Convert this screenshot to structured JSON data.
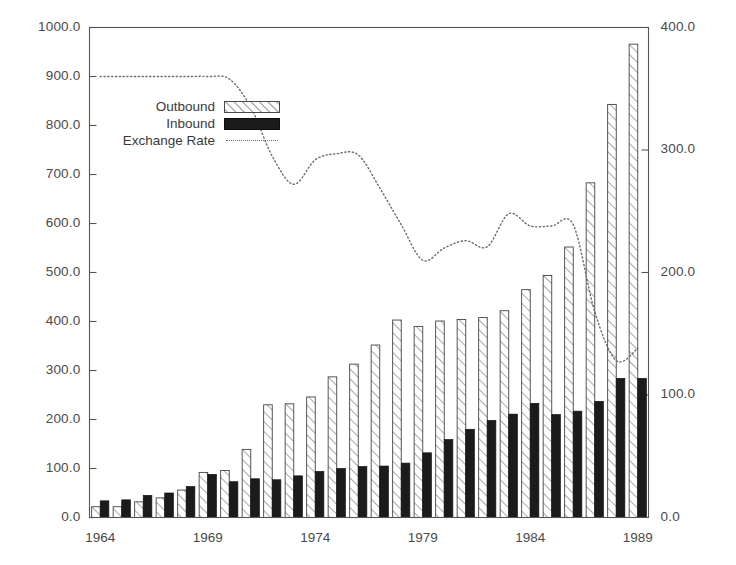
{
  "chart_data": {
    "type": "bar",
    "title": "",
    "subtitle": "",
    "xlabel": "",
    "ylabel": "",
    "y2label": "",
    "grid": false,
    "legend_position": "upper-left-inside",
    "x": [
      1964,
      1965,
      1966,
      1967,
      1968,
      1969,
      1970,
      1971,
      1972,
      1973,
      1974,
      1975,
      1976,
      1977,
      1978,
      1979,
      1980,
      1981,
      1982,
      1983,
      1984,
      1985,
      1986,
      1987,
      1988,
      1989
    ],
    "categories": [
      "1964",
      "1965",
      "1966",
      "1967",
      "1968",
      "1969",
      "1970",
      "1971",
      "1972",
      "1973",
      "1974",
      "1975",
      "1976",
      "1977",
      "1978",
      "1979",
      "1980",
      "1981",
      "1982",
      "1983",
      "1984",
      "1985",
      "1986",
      "1987",
      "1988",
      "1989"
    ],
    "xtick_labels": [
      "1964",
      "1969",
      "1974",
      "1979",
      "1984",
      "1989"
    ],
    "xtick_values": [
      1964,
      1969,
      1974,
      1979,
      1984,
      1989
    ],
    "xlim": [
      1963.5,
      1989.5
    ],
    "ylim": [
      0,
      1000
    ],
    "y2lim": [
      0,
      400
    ],
    "ytick_labels": [
      "0.0",
      "100.0",
      "200.0",
      "300.0",
      "400.0",
      "500.0",
      "600.0",
      "700.0",
      "800.0",
      "900.0",
      "1000.0"
    ],
    "ytick_values": [
      0,
      100,
      200,
      300,
      400,
      500,
      600,
      700,
      800,
      900,
      1000
    ],
    "y2tick_labels": [
      "0.0",
      "100.0",
      "200.0",
      "300.0",
      "400.0"
    ],
    "y2tick_values": [
      0,
      100,
      200,
      300,
      400
    ],
    "series": [
      {
        "name": "Outbound",
        "type": "bar",
        "axis": "left",
        "fill": "hatched",
        "color": "#ffffff",
        "edge_color": "#444444",
        "values": [
          22,
          22,
          32,
          40,
          56,
          92,
          96,
          139,
          230,
          232,
          246,
          287,
          313,
          352,
          403,
          390,
          401,
          404,
          408,
          422,
          465,
          494,
          552,
          683,
          843,
          966
        ]
      },
      {
        "name": "Inbound",
        "type": "bar",
        "axis": "left",
        "fill": "solid",
        "color": "#1b1b1b",
        "edge_color": "#111111",
        "values": [
          34,
          36,
          45,
          50,
          63,
          88,
          73,
          79,
          77,
          85,
          94,
          100,
          104,
          105,
          111,
          132,
          159,
          180,
          198,
          211,
          233,
          210,
          217,
          237,
          284,
          284
        ]
      },
      {
        "name": "Exchange Rate",
        "type": "line",
        "axis": "right",
        "style": "dotted",
        "color": "#6b6b6b",
        "values": [
          360,
          360,
          360,
          360,
          360,
          360,
          358,
          335,
          295,
          272,
          292,
          297,
          296,
          269,
          239,
          210,
          220,
          226,
          221,
          248,
          238,
          238,
          239,
          168,
          128,
          138
        ]
      }
    ],
    "legend_entries": [
      "Outbound",
      "Inbound",
      "Exchange Rate"
    ]
  },
  "axes": {
    "left": {
      "labels": [
        "1000.0",
        "900.0",
        "800.0",
        "700.0",
        "600.0",
        "500.0",
        "400.0",
        "300.0",
        "200.0",
        "100.0",
        "0.0"
      ]
    },
    "right": {
      "labels": [
        "400.0",
        "300.0",
        "200.0",
        "100.0",
        "0.0"
      ]
    },
    "bottom": {
      "labels": [
        "1964",
        "1969",
        "1974",
        "1979",
        "1984",
        "1989"
      ]
    }
  },
  "legend": {
    "items": [
      {
        "label": "Outbound",
        "swatch": "hatched-bar-swatch"
      },
      {
        "label": "Inbound",
        "swatch": "solid-bar-swatch"
      },
      {
        "label": "Exchange Rate",
        "swatch": "dotted-line-swatch"
      }
    ]
  },
  "colors": {
    "outbound_fill": "#ffffff",
    "outbound_edge": "#444444",
    "inbound_fill": "#1b1b1b",
    "exchange_line": "#6b6b6b",
    "frame": "#555555",
    "text": "#4a4a4a",
    "background": "#ffffff"
  }
}
